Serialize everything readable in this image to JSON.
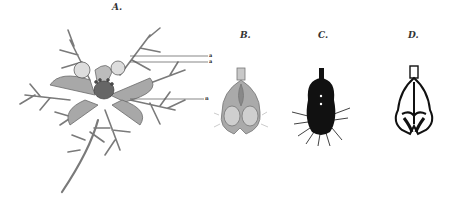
{
  "figures": [
    {
      "id": "A",
      "label": "A.",
      "subject": "whole flower with finely divided bracts"
    },
    {
      "id": "B",
      "label": "B.",
      "subject": "petal / nectary, shaded"
    },
    {
      "id": "C",
      "label": "C.",
      "subject": "petal / nectary, solid black silhouette with hairs"
    },
    {
      "id": "D",
      "label": "D.",
      "subject": "petal / nectary, black outline drawing"
    }
  ],
  "annotations": [
    {
      "label": "a",
      "y": 54
    },
    {
      "label": "a",
      "y": 60
    },
    {
      "label": "n",
      "y": 98
    }
  ],
  "colors": {
    "background": "#ffffff",
    "ink": "#1a1a1a",
    "stem": "#7a7a7a",
    "petal": "#9a9a9a",
    "petal_light": "#c8c8c8"
  }
}
